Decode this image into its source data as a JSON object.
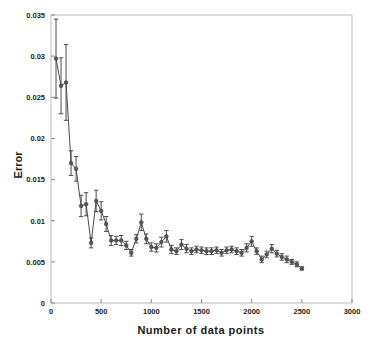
{
  "chart_data": {
    "type": "scatter",
    "title": "",
    "xlabel": "Number of data points",
    "ylabel": "Error",
    "xlim": [
      0,
      3000
    ],
    "ylim": [
      0,
      0.035
    ],
    "xticks": [
      0,
      500,
      1000,
      1500,
      2000,
      2500,
      3000
    ],
    "xtick_labels": [
      "0",
      "500",
      "1000",
      "1500",
      "2000",
      "2500",
      "3000"
    ],
    "yticks": [
      0,
      0.005,
      0.01,
      0.015,
      0.02,
      0.025,
      0.03,
      0.035
    ],
    "ytick_labels": [
      "0",
      "0.005",
      "0.01",
      "0.015",
      "0.02",
      "0.025",
      "0.03",
      "0.035"
    ],
    "grid": false,
    "legend": "none",
    "marker": "circle",
    "line_style": "solid",
    "error_bars": "symmetric-vertical",
    "series": [
      {
        "name": "Error vs number of data points",
        "color": "#4c4c4c",
        "x": [
          50,
          100,
          150,
          200,
          250,
          300,
          350,
          400,
          450,
          500,
          550,
          600,
          650,
          700,
          750,
          800,
          850,
          900,
          950,
          1000,
          1050,
          1100,
          1150,
          1200,
          1250,
          1300,
          1350,
          1400,
          1450,
          1500,
          1550,
          1600,
          1650,
          1700,
          1750,
          1800,
          1850,
          1900,
          1950,
          2000,
          2050,
          2100,
          2150,
          2200,
          2250,
          2300,
          2350,
          2400,
          2450,
          2500
        ],
        "values": [
          0.0297,
          0.0264,
          0.0268,
          0.017,
          0.0163,
          0.0118,
          0.012,
          0.0073,
          0.0124,
          0.0112,
          0.0096,
          0.0076,
          0.0076,
          0.0076,
          0.007,
          0.0061,
          0.0078,
          0.0098,
          0.0078,
          0.0068,
          0.0067,
          0.0074,
          0.0081,
          0.0065,
          0.0063,
          0.0071,
          0.0066,
          0.0063,
          0.0065,
          0.0064,
          0.0063,
          0.0063,
          0.0064,
          0.0061,
          0.0064,
          0.0065,
          0.0063,
          0.0061,
          0.0067,
          0.0075,
          0.0063,
          0.0053,
          0.0059,
          0.0066,
          0.006,
          0.0056,
          0.0053,
          0.005,
          0.0047,
          0.0042
        ],
        "errors": [
          0.0048,
          0.0034,
          0.0046,
          0.0015,
          0.0015,
          0.0013,
          0.0014,
          0.0006,
          0.0013,
          0.0011,
          0.0009,
          0.0006,
          0.0005,
          0.0006,
          0.0005,
          0.0004,
          0.0005,
          0.001,
          0.0006,
          0.0005,
          0.0005,
          0.0006,
          0.0007,
          0.0005,
          0.0004,
          0.0006,
          0.0005,
          0.0004,
          0.0004,
          0.0004,
          0.0004,
          0.0004,
          0.0004,
          0.0004,
          0.0004,
          0.0004,
          0.0004,
          0.0004,
          0.0005,
          0.0006,
          0.0004,
          0.0004,
          0.0004,
          0.0005,
          0.0004,
          0.0004,
          0.0004,
          0.0003,
          0.0003,
          0.0002
        ]
      }
    ]
  },
  "figure": {
    "axis_color": "#b9b9b9",
    "series_color": "#4c4c4c",
    "background": "#ffffff"
  }
}
